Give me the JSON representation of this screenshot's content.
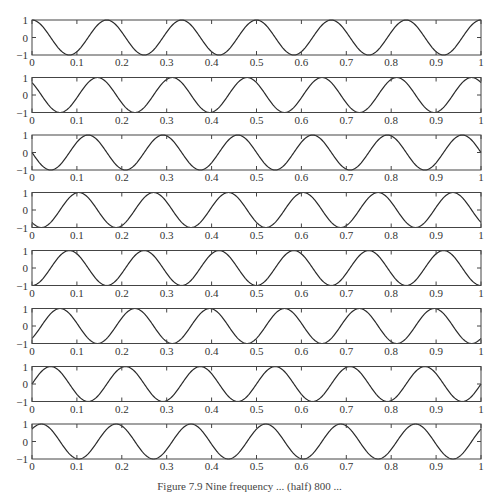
{
  "chart_data": {
    "type": "line",
    "layout": "8 vertically stacked subplots, shared x-range",
    "title": "",
    "xlabel": "",
    "ylabel": "",
    "xlim": [
      0,
      1
    ],
    "ylim": [
      -1,
      1
    ],
    "x_ticks": [
      "0",
      "0.1",
      "0.2",
      "0.3",
      "0.4",
      "0.5",
      "0.6",
      "0.7",
      "0.8",
      "0.9",
      "1"
    ],
    "y_ticks": [
      "-1",
      "0",
      "1"
    ],
    "grid": false,
    "legend": null,
    "line_color": "#2a2a2a",
    "frame_color": "#444444",
    "frequency_hz": 6,
    "function": "cos(2*pi*6*t + phase)",
    "series": [
      {
        "name": "panel-1",
        "phase_deg": 0,
        "start_value": 1.0
      },
      {
        "name": "panel-2",
        "phase_deg": 45,
        "start_value": 0.71
      },
      {
        "name": "panel-3",
        "phase_deg": 90,
        "start_value": 0.0
      },
      {
        "name": "panel-4",
        "phase_deg": 135,
        "start_value": -0.71
      },
      {
        "name": "panel-5",
        "phase_deg": 180,
        "start_value": -1.0
      },
      {
        "name": "panel-6",
        "phase_deg": 225,
        "start_value": -0.71
      },
      {
        "name": "panel-7",
        "phase_deg": 270,
        "start_value": 0.0
      },
      {
        "name": "panel-8",
        "phase_deg": 315,
        "start_value": 0.71
      }
    ]
  },
  "caption": "Figure 7.9   Nine frequency ... (half) 800 ..."
}
